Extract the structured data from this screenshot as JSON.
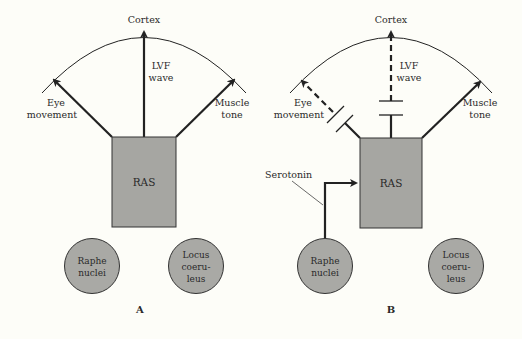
{
  "colors": {
    "background": "#fdfdf8",
    "line": "#222222",
    "box_fill": "#a6a6a2",
    "circle_fill": "#a9a9a5"
  },
  "panels": [
    {
      "id": "A",
      "label": "A",
      "cortex": "Cortex",
      "lvf": [
        "LVF",
        "wave"
      ],
      "eye": [
        "Eye",
        "movement"
      ],
      "muscle": [
        "Muscle",
        "tone"
      ],
      "ras": "RAS",
      "raphe": [
        "Raphe",
        "nuclei"
      ],
      "locus": [
        "Locus",
        "coeru-",
        "leus"
      ],
      "pathways": {
        "eye": "active",
        "lvf": "active",
        "muscle": "active"
      }
    },
    {
      "id": "B",
      "label": "B",
      "cortex": "Cortex",
      "lvf": [
        "LVF",
        "wave"
      ],
      "eye": [
        "Eye",
        "movement"
      ],
      "muscle": [
        "Muscle",
        "tone"
      ],
      "ras": "RAS",
      "raphe": [
        "Raphe",
        "nuclei"
      ],
      "locus": [
        "Locus",
        "coeru-",
        "leus"
      ],
      "serotonin": "Serotonin",
      "pathways": {
        "eye": "blocked",
        "lvf": "blocked",
        "muscle": "active"
      }
    }
  ]
}
